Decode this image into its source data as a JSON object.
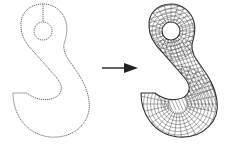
{
  "figure": {
    "left_panel": {
      "label": "",
      "icon": "hook-boundary-outline"
    },
    "arrow": {
      "icon": "right-arrow",
      "direction": "right"
    },
    "right_panel": {
      "label": "",
      "icon": "hook-quad-mesh"
    },
    "colors": {
      "line": "#333333",
      "background": "#ffffff"
    }
  }
}
